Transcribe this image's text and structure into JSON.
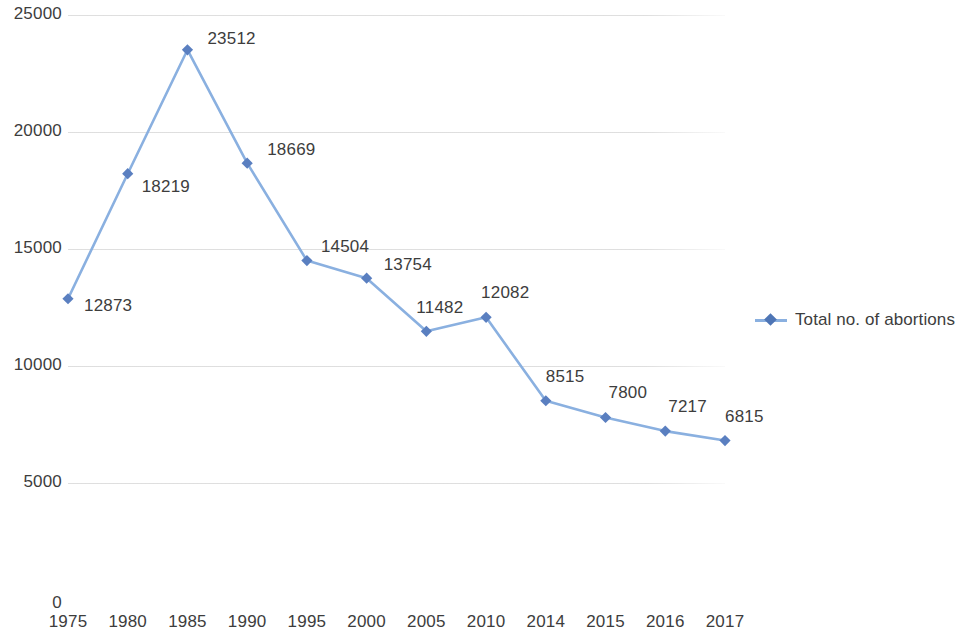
{
  "chart_data": {
    "type": "line",
    "title": "",
    "xlabel": "",
    "ylabel": "",
    "categories": [
      "1975",
      "1980",
      "1985",
      "1990",
      "1995",
      "2000",
      "2005",
      "2010",
      "2014",
      "2015",
      "2016",
      "2017"
    ],
    "series": [
      {
        "name": "Total no. of abortions",
        "values": [
          12873,
          18219,
          23512,
          18669,
          14504,
          13754,
          11482,
          12082,
          8515,
          7800,
          7217,
          6815
        ],
        "color": "#8AB0E0",
        "marker_color": "#5A7FC0",
        "marker": "diamond"
      }
    ],
    "data_labels": [
      "12873",
      "18219",
      "23512",
      "18669",
      "14504",
      "13754",
      "11482",
      "12082",
      "8515",
      "7800",
      "7217",
      "6815"
    ],
    "ylim": [
      0,
      25000
    ],
    "y_ticks": [
      "0",
      "5000",
      "10000",
      "15000",
      "20000",
      "25000"
    ],
    "grid": true,
    "grid_axis": "y",
    "legend": {
      "position": "right",
      "entries": [
        "Total no. of abortions"
      ]
    }
  },
  "legend": {
    "label": "Total no. of abortions"
  }
}
